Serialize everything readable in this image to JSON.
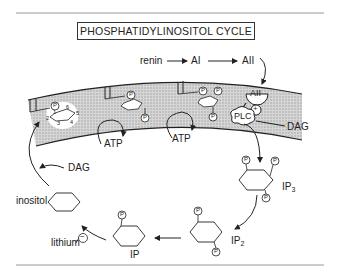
{
  "title": "PHOSPHATIDYLINOSITOL CYCLE",
  "pathway": {
    "renin": "renin",
    "angiotensin_1": "AI",
    "angiotensin_2": "AII",
    "receptor_label": "AII",
    "enzyme": "PLC",
    "activation_sign": "+"
  },
  "membrane_products": {
    "dag_right": "DAG",
    "dag_left": "DAG"
  },
  "energy": {
    "atp_1": "ATP",
    "atp_2": "ATP"
  },
  "metabolites": {
    "ip3": "IP",
    "ip3_sub": "3",
    "ip2": "IP",
    "ip2_sub": "2",
    "ip": "IP",
    "inositol": "inositol"
  },
  "inhibitor": {
    "label": "lithium",
    "sign": "−"
  },
  "ring_numbering": [
    "1",
    "2",
    "3",
    "4",
    "5",
    "6"
  ],
  "phosphate_label": "P",
  "colors": {
    "ink": "#222222",
    "membrane_fill": "#c9c9c9",
    "rule": "#999999"
  }
}
